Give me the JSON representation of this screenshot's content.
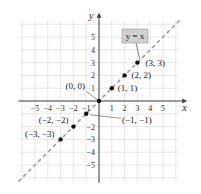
{
  "chart_data": {
    "type": "scatter",
    "title": "",
    "xlabel": "x",
    "ylabel": "y",
    "xlim": [
      -6,
      6
    ],
    "ylim": [
      -6,
      6
    ],
    "grid": true,
    "x_ticks": [
      -5,
      -4,
      -3,
      -2,
      -1,
      1,
      2,
      3,
      4,
      5
    ],
    "y_ticks": [
      5,
      4,
      3,
      2,
      1,
      -2,
      -3,
      -4,
      -5
    ],
    "line": {
      "equation": "y = x",
      "style": "dashed",
      "color": "#a0a0a0"
    },
    "points": [
      {
        "x": -3,
        "y": -3,
        "label": "(−3, −3)"
      },
      {
        "x": -2,
        "y": -2,
        "label": "(−2, −2)"
      },
      {
        "x": -1,
        "y": -1,
        "label": "(−1, −1)"
      },
      {
        "x": 0,
        "y": 0,
        "label": "(0, 0)"
      },
      {
        "x": 1,
        "y": 1,
        "label": "(1, 1)"
      },
      {
        "x": 2,
        "y": 2,
        "label": "(2, 2)"
      },
      {
        "x": 3,
        "y": 3,
        "label": "(3, 3)"
      }
    ],
    "annotations": [
      {
        "text": "y = x",
        "style": "gray box"
      }
    ]
  }
}
